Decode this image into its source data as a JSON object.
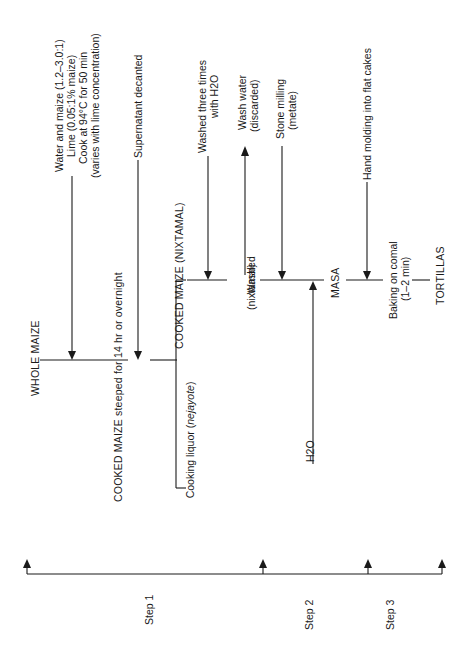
{
  "diagram": {
    "nodes": {
      "whole_maize": "WHOLE MAIZE",
      "cooked_maize_steeped": "COOKED MAIZE steeped for 14 hr or overnight",
      "cooked_maize_nixtamal": "COOKED MAIZE (NIXTAMAL)",
      "washed": "Washed",
      "washed_sub": "(nixtamal)",
      "masa": "MASA",
      "baking": "Baking on comal",
      "baking_sub": "(1–2 min)",
      "tortillas": "TORTILLAS"
    },
    "inputs": {
      "water_maize": "Water and maize (1.2–3.0:1)",
      "lime": "Lime (0.05:1% maize)",
      "cook": "Cook at 94°C for 50 min",
      "varies": "(varies with lime concentration)",
      "supernatant": "Supernatant decanted",
      "washed_three": "Washed three times",
      "washed_three_sub": "with H2O",
      "stone_milling": "Stone milling",
      "stone_milling_sub": "(metate)",
      "h2o": "H2O",
      "hand_molding": "Hand molding into flat cakes"
    },
    "outputs": {
      "cooking_liquor_prefix": "Cooking liquor (",
      "cooking_liquor_italic": "nejayote",
      "cooking_liquor_suffix": ")",
      "wash_water": "Wash water",
      "wash_water_sub": "(discarded)"
    },
    "steps": [
      {
        "label": "Step 1"
      },
      {
        "label": "Step 2"
      },
      {
        "label": "Step 3"
      }
    ],
    "colors": {
      "ink": "#1a1a1a",
      "background": "#ffffff"
    }
  }
}
